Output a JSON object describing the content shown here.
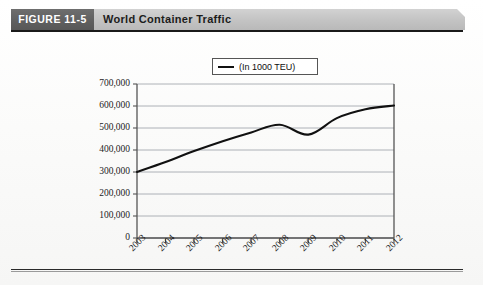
{
  "figure": {
    "number_label": "FIGURE 11-5",
    "title": "World Container Traffic"
  },
  "legend": {
    "label": "(In 1000 TEU)",
    "marker": "line-swatch-icon"
  },
  "colors": {
    "header_dark": "#606060",
    "header_light": "#c4c4c4",
    "line": "#111111",
    "grid": "#9aa0a6",
    "axis": "#555555",
    "text": "#1c1c1c",
    "page": "#fdfdfd"
  },
  "chart_data": {
    "type": "line",
    "title": "World Container Traffic",
    "xlabel": "",
    "ylabel": "",
    "series": [
      {
        "name": "(In 1000 TEU)",
        "values": [
          300000,
          345000,
          395000,
          440000,
          480000,
          515000,
          470000,
          545000,
          585000,
          602000
        ]
      }
    ],
    "categories": [
      "2003",
      "2004",
      "2005",
      "2006",
      "2007",
      "2008",
      "2009",
      "2010",
      "2011",
      "2012"
    ],
    "ylim": [
      0,
      700000
    ],
    "ytick_values": [
      0,
      100000,
      200000,
      300000,
      400000,
      500000,
      600000,
      700000
    ],
    "ytick_labels": [
      "0",
      "100,000",
      "200,000",
      "300,000",
      "400,000",
      "500,000",
      "600,000",
      "700,000"
    ],
    "grid": true,
    "grid_axis": "y",
    "legend_position": "top-center",
    "xtick_rotation": -45
  }
}
